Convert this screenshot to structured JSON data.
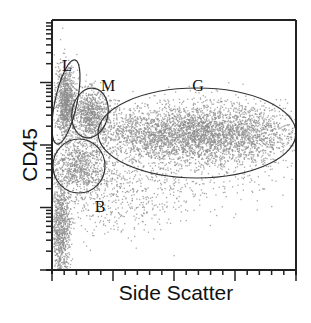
{
  "chart_data": {
    "type": "scatter",
    "title": "",
    "xlabel": "Side Scatter",
    "ylabel": "CD45",
    "x_scale": "linear",
    "y_scale": "log",
    "xlim": [
      0,
      1000
    ],
    "ylim": [
      1,
      10000
    ],
    "grid": false,
    "legend": null,
    "tick_labels_shown": false,
    "point_color": "#8c8c8c",
    "gate_color": "#333333",
    "populations": [
      {
        "name": "L",
        "description": "Lymphocytes",
        "center": [
          30,
          1000
        ],
        "spread": "low SSC, high CD45",
        "relative_density": "high"
      },
      {
        "name": "M",
        "description": "Monocytes",
        "center": [
          120,
          800
        ],
        "spread": "low-mid SSC, high CD45",
        "relative_density": "medium"
      },
      {
        "name": "G",
        "description": "Granulocytes",
        "center": [
          520,
          300
        ],
        "spread": "mid-high SSC, moderate CD45",
        "relative_density": "very high"
      },
      {
        "name": "B",
        "description": "Blasts",
        "center": [
          100,
          100
        ],
        "spread": "low SSC, dim CD45",
        "relative_density": "medium"
      }
    ],
    "gates": [
      {
        "label": "L",
        "shape": "ellipse",
        "cx": 66,
        "cy": 102,
        "rx": 11,
        "ry": 43,
        "rotation": 12
      },
      {
        "label": "M",
        "shape": "ellipse",
        "cx": 90,
        "cy": 113,
        "rx": 18,
        "ry": 25,
        "rotation": 10
      },
      {
        "label": "G",
        "shape": "ellipse",
        "cx": 197,
        "cy": 133,
        "rx": 99,
        "ry": 45,
        "rotation": 0
      },
      {
        "label": "B",
        "shape": "ellipse",
        "cx": 79,
        "cy": 166,
        "rx": 26,
        "ry": 27,
        "rotation": 0
      }
    ],
    "gate_labels": [
      {
        "text": "L",
        "x": 67,
        "y": 71
      },
      {
        "text": "M",
        "x": 108,
        "y": 91
      },
      {
        "text": "G",
        "x": 198,
        "y": 91
      },
      {
        "text": "B",
        "x": 100,
        "y": 212
      }
    ]
  }
}
